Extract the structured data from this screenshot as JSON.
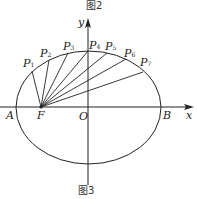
{
  "captions": {
    "top": "图2",
    "bottom": "图3"
  },
  "axes": {
    "x_label": "x",
    "y_label": "y",
    "origin_label": "O"
  },
  "points": {
    "A": "A",
    "B": "B",
    "F": "F",
    "P": [
      {
        "name": "P",
        "sub": "1"
      },
      {
        "name": "P",
        "sub": "2"
      },
      {
        "name": "P",
        "sub": "3"
      },
      {
        "name": "P",
        "sub": "4"
      },
      {
        "name": "P",
        "sub": "5"
      },
      {
        "name": "P",
        "sub": "6"
      },
      {
        "name": "P",
        "sub": "7"
      }
    ]
  }
}
